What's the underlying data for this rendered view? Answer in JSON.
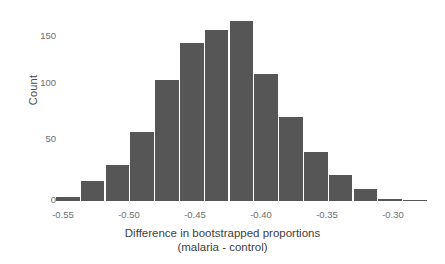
{
  "figure": {
    "axes": {
      "ylabel": "Count",
      "xlabel_line1": "Difference in bootstrapped proportions",
      "xlabel_line2": "(malaria - control)",
      "yticks": [
        "0",
        "50",
        "100",
        "150"
      ],
      "xticks": [
        "-0.55",
        "-0.50",
        "-0.45",
        "-0.40",
        "-0.35",
        "-0.30"
      ]
    },
    "style": {
      "bar_color": "#565656",
      "background": "#ffffff",
      "tick_text_color": "#6e6e6e",
      "label_text_color": "#3d3d3d"
    }
  },
  "chart_data": {
    "type": "bar",
    "title": "",
    "xlabel": "Difference in bootstrapped proportions (malaria - control)",
    "ylabel": "Count",
    "grid": false,
    "legend": null,
    "xlim": [
      -0.56,
      -0.275
    ],
    "ylim": [
      0,
      175
    ],
    "yticks": [
      0,
      50,
      100,
      150
    ],
    "xticks": [
      -0.55,
      -0.5,
      -0.45,
      -0.4,
      -0.35,
      -0.3
    ],
    "bin_width": 0.019,
    "bin_left_edges": [
      -0.5605,
      -0.5415,
      -0.5225,
      -0.5035,
      -0.4845,
      -0.4655,
      -0.4465,
      -0.4275,
      -0.4085,
      -0.3895,
      -0.3705,
      -0.3515,
      -0.3325,
      -0.3135,
      -0.2945
    ],
    "bin_centers": [
      -0.551,
      -0.532,
      -0.513,
      -0.494,
      -0.475,
      -0.456,
      -0.437,
      -0.418,
      -0.399,
      -0.38,
      -0.361,
      -0.342,
      -0.323,
      -0.304,
      -0.285
    ],
    "categories": [
      "-0.551",
      "-0.532",
      "-0.513",
      "-0.494",
      "-0.475",
      "-0.456",
      "-0.437",
      "-0.418",
      "-0.399",
      "-0.380",
      "-0.361",
      "-0.342",
      "-0.323",
      "-0.304",
      "-0.285"
    ],
    "values": [
      4,
      19,
      34,
      65,
      113,
      148,
      160,
      168,
      119,
      79,
      46,
      24,
      11,
      2,
      1
    ]
  }
}
